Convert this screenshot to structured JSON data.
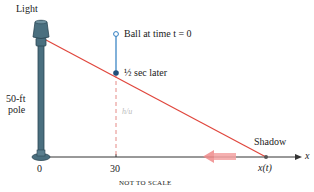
{
  "diagram": {
    "labels": {
      "light": "Light",
      "pole_line1": "50-ft",
      "pole_line2": "pole",
      "ball_start": "Ball at time t = 0",
      "ball_half": "½ sec later",
      "height_mark": "h/u",
      "shadow": "Shadow",
      "shadow_pos": "x(t)",
      "axis_x": "x",
      "tick_0": "0",
      "tick_30": "30",
      "note": "NOT TO SCALE"
    },
    "colors": {
      "pole": "#4a6f7f",
      "ray": "#e0463c",
      "ball_line": "#2d7cc0",
      "dashed": "#e58a86",
      "motion_arrow": "#f08a8a",
      "axis": "#333333"
    },
    "icons": {
      "lamp": "street-lamp-icon",
      "ball_open": "open-circle-icon",
      "ball_filled": "filled-circle-icon",
      "motion": "left-arrow-icon"
    }
  }
}
